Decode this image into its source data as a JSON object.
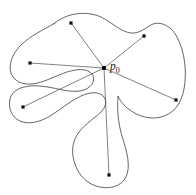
{
  "figure": {
    "type": "geometry-diagram",
    "background_color": "#ffffff",
    "stroke_color": "#4a4a4a",
    "point_color": "#111111",
    "kernel": {
      "name": "p0",
      "label_text": "p",
      "label_subscript": "0",
      "x": 104,
      "y": 68,
      "label_x": 110,
      "label_y": 67
    },
    "points": [
      {
        "id": "point-top",
        "x": 71,
        "y": 23
      },
      {
        "id": "point-upper-left",
        "x": 30,
        "y": 63
      },
      {
        "id": "point-upper-right",
        "x": 144,
        "y": 36
      },
      {
        "id": "point-lower-left",
        "x": 23,
        "y": 107
      },
      {
        "id": "point-right",
        "x": 176,
        "y": 100
      },
      {
        "id": "point-bottom",
        "x": 109,
        "y": 175
      }
    ],
    "segments": [
      {
        "id": "segment-to-top",
        "from": "p0",
        "to": "point-top"
      },
      {
        "id": "segment-to-upper-left",
        "from": "p0",
        "to": "point-upper-left"
      },
      {
        "id": "segment-to-upper-right",
        "from": "p0",
        "to": "point-upper-right"
      },
      {
        "id": "segment-to-lower-left",
        "from": "p0",
        "to": "point-lower-left"
      },
      {
        "id": "segment-to-right",
        "from": "p0",
        "to": "point-right"
      },
      {
        "id": "segment-to-bottom",
        "from": "p0",
        "to": "point-bottom"
      }
    ],
    "boundary_path": "M 55 23 C 68 12 88 11 101 17 C 113 23 121 32 131 33 C 140 34 146 27 153 24 C 162 21 172 27 177 37 C 185 52 187 72 184 89 C 181 105 173 114 161 117 C 150 120 138 116 130 110 C 124 106 120 101 118 96 C 117 108 118 123 122 136 C 127 152 131 166 126 177 C 121 187 108 190 96 186 C 84 182 77 172 74 161 C 71 150 73 140 79 132 C 86 123 95 118 101 112 C 106 107 107 101 104 97 C 99 91 90 92 81 96 C 70 101 60 110 50 116 C 40 122 29 125 20 121 C 11 117 8 107 10 99 C 12 91 20 87 30 86 C 41 85 53 88 63 90 C 73 92 82 92 88 88 C 94 84 95 78 92 74 C 87 68 77 69 67 72 C 55 76 43 83 32 84 C 22 85 14 81 11 73 C 8 64 13 53 21 45 C 30 36 43 30 55 23 Z"
  }
}
